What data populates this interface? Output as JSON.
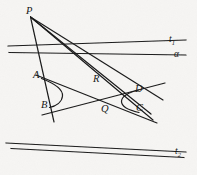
{
  "figure": {
    "background_color": "#f6f5f3",
    "ink_color": "#1a1a1a",
    "width": 197,
    "height": 175
  },
  "labels": {
    "P": {
      "text": "P",
      "x": 26,
      "y": 8
    },
    "A": {
      "text": "A",
      "x": 34,
      "y": 72
    },
    "B": {
      "text": "B",
      "x": 42,
      "y": 101
    },
    "R": {
      "text": "R",
      "x": 93,
      "y": 75
    },
    "Q": {
      "text": "Q",
      "x": 101,
      "y": 105
    },
    "C": {
      "text": "C",
      "x": 136,
      "y": 104
    },
    "D": {
      "text": "D",
      "x": 135,
      "y": 85
    },
    "t1": {
      "text": "t",
      "sub": "1",
      "x": 169,
      "y": 36
    },
    "alpha": {
      "text": "α",
      "x": 174,
      "y": 51
    },
    "t2": {
      "text": "t",
      "sub": "2",
      "x": 175,
      "y": 148
    }
  },
  "geometry": {
    "points": {
      "P": {
        "x": 30,
        "y": 16
      },
      "A": {
        "x": 42,
        "y": 79
      },
      "B": {
        "x": 50,
        "y": 106
      },
      "R": {
        "x": 99,
        "y": 84
      },
      "Q": {
        "x": 106,
        "y": 111
      },
      "C": {
        "x": 139,
        "y": 112
      },
      "D": {
        "x": 138,
        "y": 91
      }
    },
    "lines": [
      {
        "name": "line-P-B",
        "from": [
          30,
          16
        ],
        "to": [
          54,
          120
        ]
      },
      {
        "name": "line-P-A-to-C",
        "from": [
          30,
          16
        ],
        "to": [
          152,
          119
        ]
      },
      {
        "name": "line-P-R-to-C",
        "from": [
          30,
          16
        ],
        "to": [
          150,
          113
        ]
      },
      {
        "name": "line-P-to-D",
        "from": [
          30,
          16
        ],
        "to": [
          160,
          101
        ]
      },
      {
        "name": "tangent-t1",
        "from": [
          8,
          46
        ],
        "to": [
          186,
          40
        ]
      },
      {
        "name": "asymptote-alpha",
        "from": [
          9,
          52
        ],
        "to": [
          186,
          55
        ]
      },
      {
        "name": "tangent-t2",
        "from": [
          6,
          143
        ],
        "to": [
          186,
          152
        ]
      },
      {
        "name": "asymptote-2",
        "from": [
          11,
          148
        ],
        "to": [
          184,
          157
        ]
      },
      {
        "name": "chord-A-C",
        "from": [
          38,
          76
        ],
        "to": [
          155,
          122
        ]
      },
      {
        "name": "chord-B-D",
        "from": [
          44,
          113
        ],
        "to": [
          162,
          84
        ]
      }
    ],
    "conic_branches": [
      {
        "name": "left-branch",
        "description": "hyperbola branch through A and B opening left"
      },
      {
        "name": "right-branch",
        "description": "hyperbola branch through D and C opening right"
      }
    ]
  }
}
